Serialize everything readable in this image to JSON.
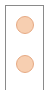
{
  "panel": {
    "border_color": "#8a8a8a",
    "background": "#ffffff"
  },
  "indicators": [
    {
      "name": "indicator-1",
      "fill": "#f7cfb1",
      "stroke": "#e6a983"
    },
    {
      "name": "indicator-2",
      "fill": "#f7cfb1",
      "stroke": "#e6a983"
    }
  ]
}
